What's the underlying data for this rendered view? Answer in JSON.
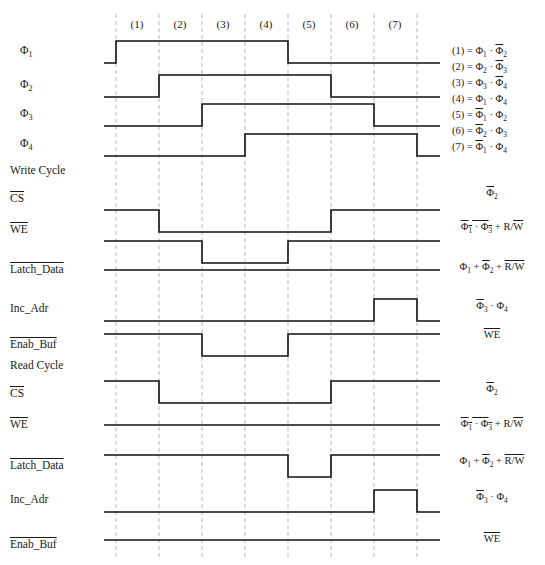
{
  "diagram": {
    "width": 545,
    "height": 565,
    "grid": {
      "x_positions": [
        116,
        159,
        202,
        245,
        288,
        331,
        374,
        417
      ],
      "top": 14,
      "bottom": 558,
      "color": "#b9b9b9",
      "dashed": true
    },
    "waveform": {
      "left_x": 104,
      "right_x": 440,
      "color": "#111111",
      "stroke_width": 1.6,
      "amplitude": 22
    },
    "phase_headers": [
      {
        "label": "(1)",
        "x": 137
      },
      {
        "label": "(2)",
        "x": 180
      },
      {
        "label": "(3)",
        "x": 223
      },
      {
        "label": "(4)",
        "x": 266
      },
      {
        "label": "(5)",
        "x": 309
      },
      {
        "label": "(6)",
        "x": 352
      },
      {
        "label": "(7)",
        "x": 395
      }
    ],
    "rows": [
      {
        "name": "phi1",
        "label_html": "&Phi;<sub>1</sub>",
        "label_x": 20,
        "label_y": 51,
        "baseline_y": 63,
        "active_low": false,
        "transitions": [
          {
            "x": 116,
            "to": 1
          },
          {
            "x": 288,
            "to": 0
          }
        ],
        "right_label_html": "",
        "right_label_x": 0,
        "right_label_y": 0
      },
      {
        "name": "phi2",
        "label_html": "&Phi;<sub>2</sub>",
        "label_x": 20,
        "label_y": 85,
        "baseline_y": 97,
        "active_low": false,
        "transitions": [
          {
            "x": 159,
            "to": 1
          },
          {
            "x": 331,
            "to": 0
          }
        ],
        "right_label_html": "",
        "right_label_x": 0,
        "right_label_y": 0
      },
      {
        "name": "phi3",
        "label_html": "&Phi;<sub>3</sub>",
        "label_x": 20,
        "label_y": 114,
        "baseline_y": 126,
        "active_low": false,
        "transitions": [
          {
            "x": 202,
            "to": 1
          },
          {
            "x": 374,
            "to": 0
          }
        ],
        "right_label_html": "",
        "right_label_x": 0,
        "right_label_y": 0
      },
      {
        "name": "phi4",
        "label_html": "&Phi;<sub>4</sub>",
        "label_x": 20,
        "label_y": 144,
        "baseline_y": 156,
        "active_low": false,
        "transitions": [
          {
            "x": 245,
            "to": 1
          },
          {
            "x": 417,
            "to": 0
          }
        ],
        "right_label_html": "",
        "right_label_x": 0,
        "right_label_y": 0
      },
      {
        "name": "write-cycle-heading",
        "label_html": "Write Cycle",
        "label_x": 10,
        "label_y": 171,
        "baseline_y": null,
        "heading": true,
        "transitions": [],
        "right_label_html": "",
        "right_label_x": 0,
        "right_label_y": 0
      },
      {
        "name": "write-cs",
        "label_html": "<span class='obar'>CS</span>",
        "label_x": 10,
        "label_y": 199,
        "baseline_y": 210,
        "active_low": true,
        "transitions": [
          {
            "x": 159,
            "to": 0
          },
          {
            "x": 331,
            "to": 1
          }
        ],
        "right_label_html": "<span class='obar'>&Phi;</span><sub>2</sub>",
        "right_label_x": 492,
        "right_label_y": 194
      },
      {
        "name": "write-we",
        "label_html": "<span class='obar'>WE</span>",
        "label_x": 10,
        "label_y": 230,
        "baseline_y": 241,
        "active_low": true,
        "transitions": [
          {
            "x": 202,
            "to": 0
          },
          {
            "x": 288,
            "to": 1
          }
        ],
        "right_label_html": "<span class='obar'>&Phi;<sub>1</sub> &middot; &Phi;<sub>3</sub></span> + R/<span class='obar'>W</span>",
        "right_label_x": 492,
        "right_label_y": 228
      },
      {
        "name": "write-latch-data",
        "label_html": "<span class='obar'>Latch_Data</span>",
        "label_x": 10,
        "label_y": 270,
        "baseline_y": 270,
        "active_low": true,
        "transitions": [],
        "right_label_html": "&Phi;<sub>1</sub> + <span class='obar'>&Phi;</span><sub>2</sub> + <span class='obar'>R/W</span>",
        "right_label_x": 492,
        "right_label_y": 268
      },
      {
        "name": "write-inc-adr",
        "label_html": "Inc_Adr",
        "label_x": 10,
        "label_y": 309,
        "baseline_y": 321,
        "active_low": false,
        "transitions": [
          {
            "x": 374,
            "to": 1
          },
          {
            "x": 417,
            "to": 0
          }
        ],
        "right_label_html": "<span class='obar'>&Phi;</span><sub>3</sub> &middot; &Phi;<sub>4</sub>",
        "right_label_x": 492,
        "right_label_y": 307
      },
      {
        "name": "write-enab-buf",
        "label_html": "<span class='obar'>Enab_Buf</span>",
        "label_x": 10,
        "label_y": 345,
        "baseline_y": 334,
        "active_low": true,
        "transitions": [
          {
            "x": 202,
            "to": 0
          },
          {
            "x": 288,
            "to": 1
          }
        ],
        "right_label_html": "<span class='obar'>WE</span>",
        "right_label_x": 492,
        "right_label_y": 336
      },
      {
        "name": "read-cycle-heading",
        "label_html": "Read Cycle",
        "label_x": 10,
        "label_y": 366,
        "baseline_y": null,
        "heading": true,
        "transitions": [],
        "right_label_html": "",
        "right_label_x": 0,
        "right_label_y": 0
      },
      {
        "name": "read-cs",
        "label_html": "<span class='obar'>CS</span>",
        "label_x": 10,
        "label_y": 394,
        "baseline_y": 381,
        "active_low": true,
        "transitions": [
          {
            "x": 159,
            "to": 0
          },
          {
            "x": 331,
            "to": 1
          }
        ],
        "right_label_html": "<span class='obar'>&Phi;</span><sub>2</sub>",
        "right_label_x": 492,
        "right_label_y": 390
      },
      {
        "name": "read-we",
        "label_html": "<span class='obar'>WE</span>",
        "label_x": 10,
        "label_y": 425,
        "baseline_y": 425,
        "active_low": true,
        "transitions": [],
        "right_label_html": "<span class='obar'>&Phi;<sub>1</sub> &middot; &Phi;<sub>3</sub></span> + R/<span class='obar'>W</span>",
        "right_label_x": 492,
        "right_label_y": 425
      },
      {
        "name": "read-latch-data",
        "label_html": "<span class='obar'>Latch_Data</span>",
        "label_x": 10,
        "label_y": 466,
        "baseline_y": 455,
        "active_low": true,
        "transitions": [
          {
            "x": 288,
            "to": 0
          },
          {
            "x": 331,
            "to": 1
          }
        ],
        "right_label_html": "&Phi;<sub>1</sub> + <span class='obar'>&Phi;</span><sub>2</sub> + <span class='obar'>R/W</span>",
        "right_label_x": 492,
        "right_label_y": 462
      },
      {
        "name": "read-inc-adr",
        "label_html": "Inc_Adr",
        "label_x": 10,
        "label_y": 500,
        "baseline_y": 512,
        "active_low": false,
        "transitions": [
          {
            "x": 374,
            "to": 1
          },
          {
            "x": 417,
            "to": 0
          }
        ],
        "right_label_html": "<span class='obar'>&Phi;</span><sub>3</sub> &middot; &Phi;<sub>4</sub>",
        "right_label_x": 492,
        "right_label_y": 498
      },
      {
        "name": "read-enab-buf",
        "label_html": "<span class='obar'>Enab_Buf</span>",
        "label_x": 10,
        "label_y": 545,
        "baseline_y": 540,
        "active_low": true,
        "transitions": [],
        "right_label_html": "<span class='obar'>WE</span>",
        "right_label_x": 492,
        "right_label_y": 540
      }
    ],
    "legend": [
      {
        "index": "(1)",
        "expr_html": "(1) = &Phi;<sub>1</sub> &middot; <span class='obar'>&Phi;</span><sub>2</sub>",
        "x": 452,
        "y": 52
      },
      {
        "index": "(2)",
        "expr_html": "(2) = &Phi;<sub>2</sub> &middot; <span class='obar'>&Phi;</span><sub>3</sub>",
        "x": 452,
        "y": 68
      },
      {
        "index": "(3)",
        "expr_html": "(3) = &Phi;<sub>3</sub> &middot; <span class='obar'>&Phi;</span><sub>4</sub>",
        "x": 452,
        "y": 84
      },
      {
        "index": "(4)",
        "expr_html": "(4) = &Phi;<sub>1</sub> &middot; &Phi;<sub>4</sub>",
        "x": 452,
        "y": 100
      },
      {
        "index": "(5)",
        "expr_html": "(5) = <span class='obar'>&Phi;</span><sub>1</sub> &middot; &Phi;<sub>2</sub>",
        "x": 452,
        "y": 116
      },
      {
        "index": "(6)",
        "expr_html": "(6) = <span class='obar'>&Phi;</span><sub>2</sub> &middot; &Phi;<sub>3</sub>",
        "x": 452,
        "y": 132
      },
      {
        "index": "(7)",
        "expr_html": "(7) = <span class='obar'>&Phi;</span><sub>1</sub> &middot; &Phi;<sub>4</sub>",
        "x": 452,
        "y": 148
      }
    ]
  }
}
